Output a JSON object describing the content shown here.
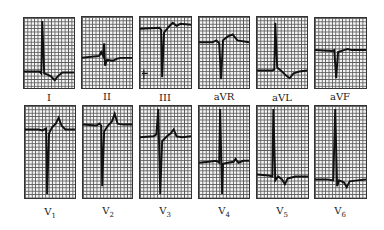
{
  "figure": {
    "type": "12-lead electrocardiogram",
    "rows": [
      {
        "leads": [
          {
            "id": "I",
            "label": "I",
            "sub": ""
          },
          {
            "id": "II",
            "label": "II",
            "sub": ""
          },
          {
            "id": "III",
            "label": "III",
            "sub": ""
          },
          {
            "id": "aVR",
            "label": "aVR",
            "sub": ""
          },
          {
            "id": "aVL",
            "label": "aVL",
            "sub": ""
          },
          {
            "id": "aVF",
            "label": "aVF",
            "sub": ""
          }
        ]
      },
      {
        "leads": [
          {
            "id": "V1",
            "label": "V",
            "sub": "1"
          },
          {
            "id": "V2",
            "label": "V",
            "sub": "2"
          },
          {
            "id": "V3",
            "label": "V",
            "sub": "3"
          },
          {
            "id": "V4",
            "label": "V",
            "sub": "4"
          },
          {
            "id": "V5",
            "label": "V",
            "sub": "5"
          },
          {
            "id": "V6",
            "label": "V",
            "sub": "6"
          }
        ]
      }
    ],
    "colors": {
      "trace": "#111111",
      "grid": "#5a5a5a",
      "paper": "#f4f4f4"
    }
  }
}
